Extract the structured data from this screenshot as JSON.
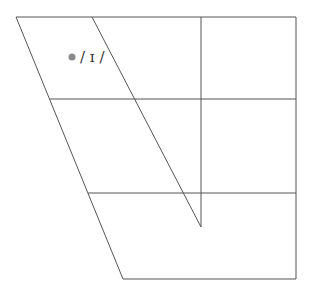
{
  "diagram": {
    "type": "vowel-chart-trapezoid",
    "line_color": "#555555",
    "dot_color": "#8a8a8a",
    "vowels": [
      {
        "symbol": "/ɪ/",
        "label": "/ ɪ /",
        "x": 72,
        "y": 57
      }
    ]
  }
}
